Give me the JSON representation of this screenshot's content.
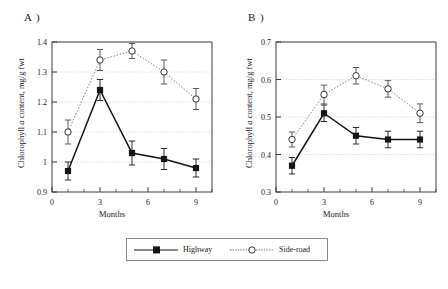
{
  "figure": {
    "panels": [
      {
        "label": "A )",
        "name": "panel-a",
        "ylabel_prefix": "Chlorophyll ",
        "ylabel_italic": "a",
        "ylabel_suffix": " content, mg/g fwt",
        "xlabel": "Months"
      },
      {
        "label": "B )",
        "name": "panel-b",
        "ylabel_prefix": "Chlorophyll ",
        "ylabel_italic": "a",
        "ylabel_suffix": " content, mg/g fwt",
        "xlabel": "Months"
      }
    ],
    "legend": {
      "items": [
        {
          "label": "Highway",
          "style": "solid",
          "marker": "filled-square",
          "color": "#141414"
        },
        {
          "label": "Side-road",
          "style": "dotted",
          "marker": "open-circle",
          "color": "#555555"
        }
      ]
    }
  },
  "chart_data": [
    {
      "type": "line",
      "panel": "A",
      "title": "A )",
      "xlabel": "Months",
      "ylabel": "Chlorophyll a content, mg/g fwt",
      "xlim": [
        0,
        10
      ],
      "ylim": [
        0.9,
        1.4
      ],
      "xticks": [
        0,
        3,
        6,
        9
      ],
      "xtick_labels": [
        "0",
        "3",
        "6",
        "9"
      ],
      "xminor_ticks": [
        1,
        2,
        4,
        5,
        7,
        8,
        10
      ],
      "yticks": [
        0.9,
        1.0,
        1.1,
        1.2,
        1.3,
        1.4
      ],
      "ytick_labels": [
        "0.9",
        "1",
        "1.1",
        "1.2",
        "1.3",
        "1.4"
      ],
      "grid": true,
      "legend_position": "below-figure",
      "x": [
        1,
        3,
        5,
        7,
        9
      ],
      "series": [
        {
          "name": "Highway",
          "values": [
            0.97,
            1.24,
            1.03,
            1.01,
            0.98
          ],
          "errors": [
            0.03,
            0.035,
            0.04,
            0.035,
            0.03
          ],
          "marker": "filled-square",
          "style": "solid"
        },
        {
          "name": "Side-road",
          "values": [
            1.1,
            1.34,
            1.37,
            1.3,
            1.21
          ],
          "errors": [
            0.04,
            0.035,
            0.025,
            0.04,
            0.035
          ],
          "marker": "open-circle",
          "style": "dotted"
        }
      ]
    },
    {
      "type": "line",
      "panel": "B",
      "title": "B )",
      "xlabel": "Months",
      "ylabel": "Chlorophyll a content, mg/g fwt",
      "xlim": [
        0,
        10
      ],
      "ylim": [
        0.3,
        0.7
      ],
      "xticks": [
        0,
        3,
        6,
        9
      ],
      "xtick_labels": [
        "0",
        "3",
        "6",
        "9"
      ],
      "xminor_ticks": [
        1,
        2,
        4,
        5,
        7,
        8,
        10
      ],
      "yticks": [
        0.3,
        0.4,
        0.5,
        0.6,
        0.7
      ],
      "ytick_labels": [
        "0.3",
        "0.4",
        "0.5",
        "0.6",
        "0.7"
      ],
      "grid": true,
      "legend_position": "below-figure",
      "x": [
        1,
        3,
        5,
        7,
        9
      ],
      "series": [
        {
          "name": "Highway",
          "values": [
            0.37,
            0.51,
            0.45,
            0.44,
            0.44
          ],
          "errors": [
            0.022,
            0.022,
            0.022,
            0.022,
            0.022
          ],
          "marker": "filled-square",
          "style": "solid"
        },
        {
          "name": "Side-road",
          "values": [
            0.44,
            0.56,
            0.61,
            0.575,
            0.51
          ],
          "errors": [
            0.02,
            0.025,
            0.022,
            0.022,
            0.025
          ],
          "marker": "open-circle",
          "style": "dotted"
        }
      ]
    }
  ]
}
